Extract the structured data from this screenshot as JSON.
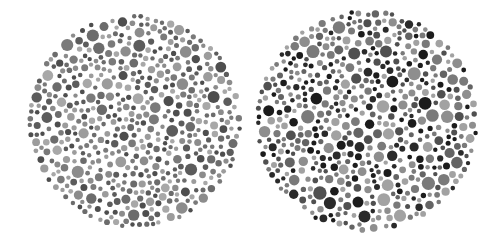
{
  "image": {
    "width": 502,
    "height": 247,
    "background": "#ffffff",
    "description": "Two grayscale Ishihara-style dot plates side by side"
  },
  "plates": [
    {
      "id": "left",
      "center": [
        135,
        121
      ],
      "radius": 108,
      "seed": 17,
      "dot_count": 900,
      "min_r": 2.2,
      "max_r": 6.2,
      "palette": [
        "#4e4e4e",
        "#5c5c5c",
        "#6c6c6c",
        "#7a7a7a",
        "#8c8c8c",
        "#9c9c9c",
        "#a8a8a8"
      ]
    },
    {
      "id": "right",
      "center": [
        367,
        121
      ],
      "radius": 112,
      "seed": 91,
      "dot_count": 820,
      "min_r": 2.2,
      "max_r": 7.0,
      "palette": [
        "#1c1c1c",
        "#2a2a2a",
        "#505050",
        "#646464",
        "#7a7a7a",
        "#8e8e8e",
        "#a2a2a2"
      ]
    }
  ]
}
